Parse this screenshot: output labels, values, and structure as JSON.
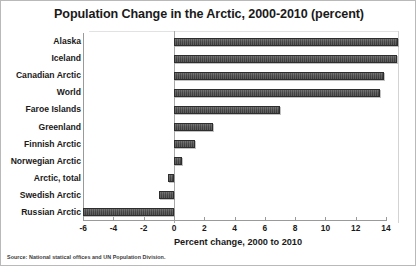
{
  "chart_data": {
    "type": "bar",
    "orientation": "horizontal",
    "title": "Population Change in the Arctic, 2000-2010 (percent)",
    "xlabel": "Percent change, 2000 to 2010",
    "ylabel": "",
    "xlim": [
      -6,
      14
    ],
    "xticks": [
      -6,
      -4,
      -2,
      0,
      2,
      4,
      6,
      8,
      10,
      12,
      14
    ],
    "xtick_labels": [
      "-6",
      "-4",
      "-2",
      "0",
      "2",
      "4",
      "6",
      "8",
      "10",
      "12",
      "14"
    ],
    "grid": false,
    "legend": null,
    "categories": [
      "Alaska",
      "Iceland",
      "Canadian Arctic",
      "World",
      "Faroe Islands",
      "Greenland",
      "Finnish Arctic",
      "Norwegian Arctic",
      "Arctic, total",
      "Swedish Arctic",
      "Russian Arctic"
    ],
    "values": [
      14.8,
      14.7,
      13.9,
      13.6,
      7.0,
      2.6,
      1.4,
      0.5,
      -0.4,
      -1.0,
      -6.0
    ],
    "bar_color": "#464646",
    "source": "Source: National statical offices and UN Population Division."
  }
}
